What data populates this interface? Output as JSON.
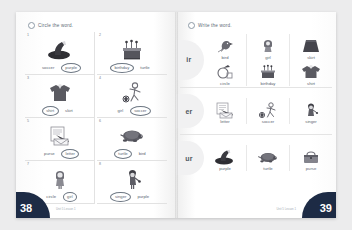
{
  "left_page": {
    "instruction": "Circle the word.",
    "page_number": "38",
    "footnote": "Unit 5  Lesson 1",
    "questions": [
      {
        "number": "1",
        "icon": "purple-hat-icon",
        "option_a": "soccer",
        "option_b": "purple",
        "circled": "b"
      },
      {
        "number": "2",
        "icon": "birthday-cake-icon",
        "option_a": "birthday",
        "option_b": "turtle",
        "circled": "a"
      },
      {
        "number": "3",
        "icon": "shirt-icon",
        "option_a": "shirt",
        "option_b": "skirt",
        "circled": "a"
      },
      {
        "number": "4",
        "icon": "soccer-player-icon",
        "option_a": "girl",
        "option_b": "soccer",
        "circled": "b"
      },
      {
        "number": "5",
        "icon": "letter-icon",
        "option_a": "purse",
        "option_b": "letter",
        "circled": "b"
      },
      {
        "number": "6",
        "icon": "turtle-icon",
        "option_a": "turtle",
        "option_b": "bird",
        "circled": "a"
      },
      {
        "number": "7",
        "icon": "girl-icon",
        "option_a": "circle",
        "option_b": "girl",
        "circled": "b"
      },
      {
        "number": "8",
        "icon": "singer-icon",
        "option_a": "singer",
        "option_b": "purple",
        "circled": "a"
      }
    ]
  },
  "right_page": {
    "instruction": "Write the word.",
    "page_number": "39",
    "footnote": "Unit 5  Lesson 1",
    "sections": [
      {
        "sound": "ir",
        "rows": [
          [
            {
              "word": "bird",
              "icon": "bird-icon"
            },
            {
              "word": "girl",
              "icon": "girl-icon"
            },
            {
              "word": "skirt",
              "icon": "skirt-icon"
            }
          ],
          [
            {
              "word": "circle",
              "icon": "circle-icon"
            },
            {
              "word": "birthday",
              "icon": "birthday-cake-icon"
            },
            {
              "word": "shirt",
              "icon": "shirt-icon"
            }
          ]
        ]
      },
      {
        "sound": "er",
        "rows": [
          [
            {
              "word": "letter",
              "icon": "letter-icon"
            },
            {
              "word": "soccer",
              "icon": "soccer-player-icon"
            },
            {
              "word": "singer",
              "icon": "singer-icon"
            }
          ]
        ]
      },
      {
        "sound": "ur",
        "rows": [
          [
            {
              "word": "purple",
              "icon": "purple-hat-icon"
            },
            {
              "word": "turtle",
              "icon": "turtle-icon"
            },
            {
              "word": "purse",
              "icon": "purse-icon"
            }
          ]
        ]
      }
    ]
  },
  "colors": {
    "page_corner": "#1d2b45",
    "text": "#5a6470",
    "bubble": "#f1f1f2"
  }
}
